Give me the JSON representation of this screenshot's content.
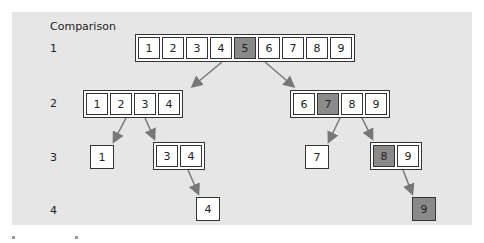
{
  "header": "Comparison",
  "rows": [
    "1",
    "2",
    "3",
    "4"
  ],
  "levels": {
    "l1": {
      "values": [
        "1",
        "2",
        "3",
        "4",
        "5",
        "6",
        "7",
        "8",
        "9"
      ],
      "highlight": "5"
    },
    "l2a": {
      "values": [
        "1",
        "2",
        "3",
        "4"
      ]
    },
    "l2b": {
      "values": [
        "6",
        "7",
        "8",
        "9"
      ],
      "highlight": "7"
    },
    "l3a": {
      "value": "1"
    },
    "l3b": {
      "values": [
        "3",
        "4"
      ]
    },
    "l3c": {
      "value": "7"
    },
    "l3d": {
      "values": [
        "8",
        "9"
      ],
      "highlight": "8"
    },
    "l4a": {
      "value": "4"
    },
    "l4b": {
      "value": "9",
      "highlight": true
    }
  },
  "colors": {
    "highlight": "#8a8a8a",
    "arrow": "#777777",
    "panel": "#e6e6e6"
  }
}
